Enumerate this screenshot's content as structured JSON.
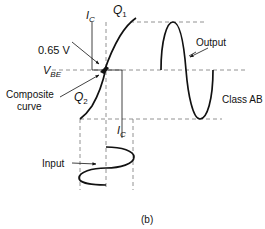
{
  "figure": {
    "caption": "(b)",
    "labels": {
      "ic_top": "I",
      "ic_top_sub": "C",
      "ic_bottom": "I",
      "ic_bottom_sub": "C",
      "q1": "Q",
      "q1_sub": "1",
      "q2": "Q",
      "q2_sub": "2",
      "vbe": "V",
      "vbe_sub": "BE",
      "threshold": "0.65 V",
      "composite_line1": "Composite",
      "composite_line2": "curve",
      "output": "Output",
      "input": "Input",
      "class": "Class AB"
    }
  }
}
